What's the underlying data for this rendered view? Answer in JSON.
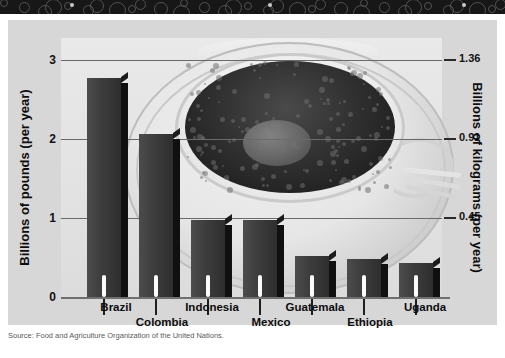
{
  "banner": {
    "name": "decorative-swirl-banner"
  },
  "chart_data": {
    "type": "bar",
    "title": "",
    "categories": [
      "Brazil",
      "Colombia",
      "Indonesia",
      "Mexico",
      "Guatemala",
      "Ethiopia",
      "Uganda"
    ],
    "values": [
      2.54,
      1.89,
      0.89,
      0.89,
      0.47,
      0.44,
      0.39
    ],
    "xlabel": "",
    "ylabel": "Billions of pounds (per year)",
    "ylabel_right": "Billions of kilograms (per year)",
    "ylim": [
      0,
      3
    ],
    "yticks": [
      "0",
      "1",
      "2",
      "3"
    ],
    "yticks_right": [
      "0.45",
      "0.91",
      "1.36"
    ],
    "grid": true,
    "legend": "none"
  },
  "axes": {
    "left_title": "Billions of pounds (per year)",
    "right_title": "Billions of kilograms (per year)",
    "left_ticks": [
      {
        "label": "3",
        "top": 35
      },
      {
        "label": "2",
        "top": 114
      },
      {
        "label": "1",
        "top": 193
      },
      {
        "label": "0",
        "top": 272
      }
    ],
    "right_ticks": [
      {
        "label": "1.36",
        "top": 33
      },
      {
        "label": "0.91",
        "top": 112
      },
      {
        "label": "0.45",
        "top": 191
      }
    ]
  },
  "bars": [
    {
      "label": "Brazil",
      "value": 2.54,
      "left": 26,
      "label_left": 20,
      "label_row": 0
    },
    {
      "label": "Colombia",
      "value": 1.89,
      "left": 78,
      "label_left": 66,
      "label_row": 1
    },
    {
      "label": "Indonesia",
      "value": 0.89,
      "left": 130,
      "label_left": 116,
      "label_row": 0
    },
    {
      "label": "Mexico",
      "value": 0.89,
      "left": 182,
      "label_left": 175,
      "label_row": 1
    },
    {
      "label": "Guatemala",
      "value": 0.47,
      "left": 234,
      "label_left": 219,
      "label_row": 0
    },
    {
      "label": "Ethiopia",
      "value": 0.44,
      "left": 286,
      "label_left": 274,
      "label_row": 1
    },
    {
      "label": "Uganda",
      "value": 0.39,
      "left": 338,
      "label_left": 329,
      "label_row": 0
    }
  ],
  "source": {
    "text": "Source: Food and Agriculture Organization of the United Nations."
  },
  "colors": {
    "bar_face": "#3c3c3c",
    "bar_side": "#101010",
    "frame_bg": "#d7d7d7",
    "plot_bg": "#e6e6e6",
    "banner": "#171717",
    "gridline": "#6a6a6a"
  }
}
